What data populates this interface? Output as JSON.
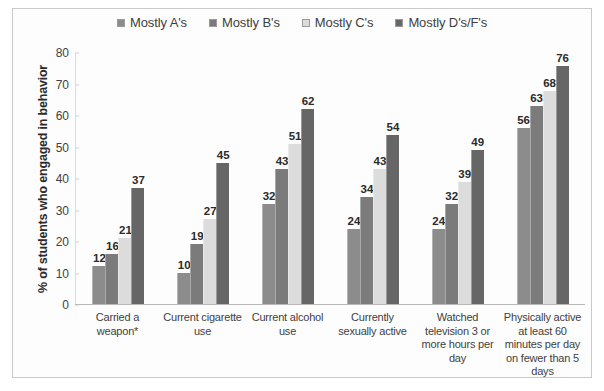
{
  "chart_data": {
    "type": "bar",
    "title": "",
    "xlabel": "",
    "ylabel": "% of students who engaged in behavior",
    "ylim": [
      0,
      80
    ],
    "yticks": [
      0,
      10,
      20,
      30,
      40,
      50,
      60,
      70,
      80
    ],
    "grid": false,
    "legend_position": "top-center",
    "categories": [
      "Carried a weapon*",
      "Current cigarette use",
      "Current alcohol use",
      "Currently sexually active",
      "Watched television 3 or more hours per day",
      "Physically active at least 60 minutes per day on fewer than 5 days"
    ],
    "series": [
      {
        "name": "Mostly A's",
        "color": "#8c8c8c",
        "values": [
          12,
          10,
          32,
          24,
          24,
          56
        ]
      },
      {
        "name": "Mostly B's",
        "color": "#7b7b7b",
        "values": [
          16,
          19,
          43,
          34,
          32,
          63
        ]
      },
      {
        "name": "Mostly C's",
        "color": "#dcdcdc",
        "values": [
          21,
          27,
          51,
          43,
          39,
          68
        ]
      },
      {
        "name": "Mostly D's/F's",
        "color": "#666666",
        "values": [
          37,
          45,
          62,
          54,
          49,
          76
        ]
      }
    ]
  }
}
